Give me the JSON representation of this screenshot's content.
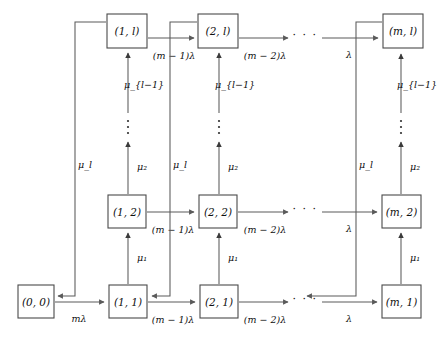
{
  "diagram": {
    "type": "state-transition-diagram",
    "colors": {
      "background": "#ffffff",
      "box_stroke": "#4a4a4a",
      "edge_stroke": "#5a5a5a",
      "text": "#101010"
    },
    "nodes": [
      {
        "id": "n00",
        "label": "(0, 0)",
        "x": 18,
        "y": 285,
        "w": 36,
        "h": 33
      },
      {
        "id": "n11",
        "label": "(1, 1)",
        "x": 109,
        "y": 285,
        "w": 38,
        "h": 33
      },
      {
        "id": "n12",
        "label": "(1, 2)",
        "x": 108,
        "y": 195,
        "w": 38,
        "h": 33
      },
      {
        "id": "n1l",
        "label": "(1, l)",
        "x": 107,
        "y": 14,
        "w": 40,
        "h": 34
      },
      {
        "id": "n21",
        "label": "(2, 1)",
        "x": 200,
        "y": 285,
        "w": 38,
        "h": 33
      },
      {
        "id": "n22",
        "label": "(2, 2)",
        "x": 199,
        "y": 195,
        "w": 38,
        "h": 33
      },
      {
        "id": "n2l",
        "label": "(2, l)",
        "x": 198,
        "y": 14,
        "w": 40,
        "h": 34
      },
      {
        "id": "nm1",
        "label": "(m, 1)",
        "x": 382,
        "y": 285,
        "w": 39,
        "h": 33
      },
      {
        "id": "nm2",
        "label": "(m, 2)",
        "x": 382,
        "y": 195,
        "w": 39,
        "h": 33
      },
      {
        "id": "nml",
        "label": "(m, l)",
        "x": 383,
        "y": 14,
        "w": 40,
        "h": 34
      }
    ],
    "labels": {
      "lambda_m": "mλ",
      "lambda_m1": "(m − 1)λ",
      "lambda_m2": "(m − 2)λ",
      "lambda": "λ",
      "mu_1": "μ₁",
      "mu_2": "μ₂",
      "mu_l": "μ_l",
      "mu_l1": "μ_{l−1}",
      "ellipsis": "· · ·"
    },
    "edges": [
      {
        "from": "n00",
        "to": "n11",
        "label": "mλ",
        "row": "bottom"
      },
      {
        "from": "n11",
        "to": "n21",
        "label": "(m − 1)λ",
        "row": "bottom"
      },
      {
        "from": "n21",
        "to": "dots1",
        "label": "(m − 2)λ",
        "row": "bottom"
      },
      {
        "from": "dots1",
        "to": "nm1",
        "label": "λ",
        "row": "bottom"
      },
      {
        "from": "n12",
        "to": "n22",
        "label": "(m − 1)λ",
        "row": "middle"
      },
      {
        "from": "n22",
        "to": "dots2",
        "label": "(m − 2)λ",
        "row": "middle"
      },
      {
        "from": "dots2",
        "to": "nm2",
        "label": "λ",
        "row": "middle"
      },
      {
        "from": "n1l",
        "to": "n2l",
        "label": "(m − 1)λ",
        "row": "top"
      },
      {
        "from": "n2l",
        "to": "dots3",
        "label": "(m − 2)λ",
        "row": "top"
      },
      {
        "from": "dots3",
        "to": "nml",
        "label": "λ",
        "row": "top"
      },
      {
        "from": "n11",
        "to": "n12",
        "label": "μ₁",
        "dir": "up"
      },
      {
        "from": "n21",
        "to": "n22",
        "label": "μ₁",
        "dir": "up"
      },
      {
        "from": "nm1",
        "to": "nm2",
        "label": "μ₁",
        "dir": "up"
      },
      {
        "from": "n12",
        "to": "n1l",
        "label": "μ₂",
        "dir": "up"
      },
      {
        "from": "n22",
        "to": "n2l",
        "label": "μ₂",
        "dir": "up"
      },
      {
        "from": "nm2",
        "to": "nml",
        "label": "μ₂",
        "dir": "up"
      },
      {
        "from": "n1l",
        "to": "n00",
        "label": "μ_l",
        "dir": "feedback"
      },
      {
        "from": "n2l",
        "to": "n11",
        "label": "μ_l",
        "dir": "feedback"
      },
      {
        "from": "nml",
        "to": "dots1",
        "label": "μ_l",
        "dir": "feedback"
      }
    ],
    "column_labels": {
      "mu_l_left": "μ_l",
      "mu_l_col2": "μ_l",
      "mu_l_colm": "μ_l"
    }
  }
}
